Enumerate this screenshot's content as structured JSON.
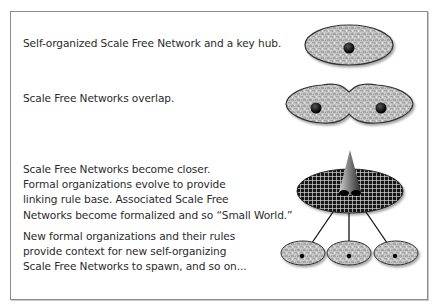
{
  "diagram": {
    "steps": [
      {
        "id": "step-1",
        "lines": [
          "Self-organized Scale Free Network and a key hub."
        ],
        "illustration": "single-network-with-hub"
      },
      {
        "id": "step-2",
        "lines": [
          "Scale Free Networks overlap."
        ],
        "illustration": "two-overlapping-networks"
      },
      {
        "id": "step-3",
        "lines": [
          "Scale Free Networks become closer.",
          "Formal organizations evolve to provide",
          "linking rule base. Associated Scale Free",
          "Networks become formalized and so “Small World.”"
        ],
        "illustration": "grid-ellipse-with-cone"
      },
      {
        "id": "step-4",
        "lines": [
          "New formal organizations and their rules",
          "provide context for new self-organizing",
          "Scale Free Networks to spawn, and so on..."
        ],
        "illustration": "three-spawned-networks-linked"
      }
    ],
    "colors": {
      "frame": "#8c8c8c",
      "text": "#2b2b2b",
      "network_fill": "#bdbdbd",
      "outline": "#333333",
      "hub": "#000000",
      "grid_fill": "#1a1a1a",
      "grid_lines": "#e0e0e0"
    }
  }
}
